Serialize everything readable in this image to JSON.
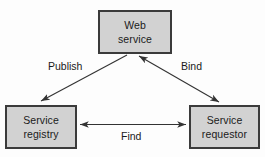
{
  "diagram": {
    "background_color": "#fdfdfd",
    "node_fill_color": "#d2d2d2",
    "node_border_color": "#3b3b3b",
    "edge_color": "#333333",
    "text_color": "#1a1a1a",
    "nodes": [
      {
        "id": "web-service",
        "line1": "Web",
        "line2": "service"
      },
      {
        "id": "service-registry",
        "line1": "Service",
        "line2": "registry"
      },
      {
        "id": "service-requestor",
        "line1": "Service",
        "line2": "requestor"
      }
    ],
    "edges": [
      {
        "id": "publish",
        "label": "Publish",
        "from": "web-service",
        "to": "service-registry",
        "arrowheads": "single"
      },
      {
        "id": "bind",
        "label": "Bind",
        "from": "service-requestor",
        "to": "web-service",
        "arrowheads": "double"
      },
      {
        "id": "find",
        "label": "Find",
        "from": "service-registry",
        "to": "service-requestor",
        "arrowheads": "double"
      }
    ]
  }
}
